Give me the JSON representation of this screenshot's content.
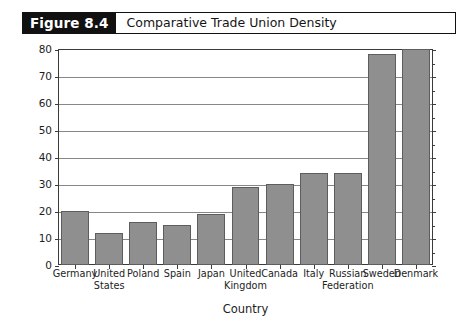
{
  "figure": {
    "number_label": "Figure 8.4",
    "title": "Comparative Trade Union Density"
  },
  "chart_data": {
    "type": "bar",
    "title": "Comparative Trade Union Density",
    "xlabel": "Country",
    "ylabel": "Union Density*",
    "ylim": [
      0,
      80
    ],
    "yticks": [
      0,
      10,
      20,
      30,
      40,
      50,
      60,
      70,
      80
    ],
    "ytick_labels": [
      "0",
      "10",
      "20",
      "30",
      "40",
      "50",
      "60",
      "70",
      "80"
    ],
    "grid": true,
    "legend": "none",
    "categories": [
      "Germany",
      "United States",
      "Poland",
      "Spain",
      "Japan",
      "United Kingdom",
      "Canada",
      "Italy",
      "Russian Federation",
      "Sweden",
      "Denmark"
    ],
    "category_lines": [
      [
        "Germany"
      ],
      [
        "United",
        "States"
      ],
      [
        "Poland"
      ],
      [
        "Spain"
      ],
      [
        "Japan"
      ],
      [
        "United",
        "Kingdom"
      ],
      [
        "Canada"
      ],
      [
        "Italy"
      ],
      [
        "Russian",
        "Federation"
      ],
      [
        "Sweden"
      ],
      [
        "Denmark"
      ]
    ],
    "values": [
      20,
      12,
      16,
      15,
      19,
      29,
      30,
      34,
      34,
      78,
      80
    ],
    "bar_color": "#8f8f8f",
    "bar_border_color": "#5d5d5d",
    "gridline_color": "#878787",
    "axis_color": "#3b3b3b"
  }
}
